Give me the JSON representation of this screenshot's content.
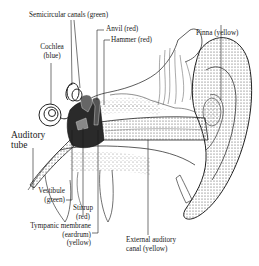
{
  "diagram": {
    "labels": {
      "semicircular": "Semicircular canals (green)",
      "anvil": "Anvil (red)",
      "hammer": "Hammer (red)",
      "pinna": "Pinna (yellow)",
      "cochlea_1": "Cochlea",
      "cochlea_2": "(blue)",
      "auditory_1": "Auditory",
      "auditory_2": "tube",
      "vestibule_1": "Vestibule",
      "vestibule_2": "(green)",
      "stirrup_1": "Stirrup",
      "stirrup_2": "(red)",
      "tympanic_1": "Tympanic membrane",
      "tympanic_2": "(eardrum)",
      "tympanic_3": "(yellow)",
      "external_1": "External auditory",
      "external_2": "canal (yellow)"
    },
    "colors": {
      "line": "#1a1a1a",
      "shade": "#6a6a6a",
      "dark": "#2a2a2a",
      "background": "#ffffff"
    }
  }
}
